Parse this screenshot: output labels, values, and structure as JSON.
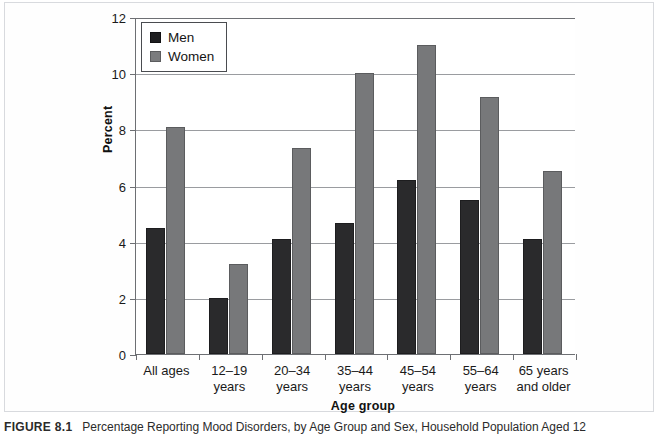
{
  "caption": {
    "label": "FIGURE 8.1",
    "text": "Percentage Reporting Mood Disorders, by Age Group and Sex, Household Population Aged 12"
  },
  "legend": {
    "items": [
      {
        "label": "Men",
        "color": "#1f1f21"
      },
      {
        "label": "Women",
        "color": "#7b7c7e"
      }
    ]
  },
  "chart_data": {
    "type": "bar",
    "title": "",
    "xlabel": "Age group",
    "ylabel": "Percent",
    "ylim": [
      0,
      12
    ],
    "yticks": [
      0,
      2,
      4,
      6,
      8,
      10,
      12
    ],
    "ytick_labels": [
      "0",
      "2",
      "4",
      "6",
      "8",
      "10",
      "12"
    ],
    "grid": true,
    "legend_position": "top-left-inside",
    "categories": [
      "All ages",
      "12–19 years",
      "20–34 years",
      "35–44 years",
      "45–54 years",
      "55–64 years",
      "65 years and older"
    ],
    "category_lines": [
      [
        "All ages",
        ""
      ],
      [
        "12–19",
        "years"
      ],
      [
        "20–34",
        "years"
      ],
      [
        "35–44",
        "years"
      ],
      [
        "45–54",
        "years"
      ],
      [
        "55–64",
        "years"
      ],
      [
        "65 years",
        "and older"
      ]
    ],
    "series": [
      {
        "name": "Men",
        "color": "#2a2a2c",
        "values": [
          4.5,
          2.0,
          4.1,
          4.65,
          6.2,
          5.5,
          4.1
        ]
      },
      {
        "name": "Women",
        "color": "#77787a",
        "values": [
          8.1,
          3.2,
          7.35,
          10.0,
          11.0,
          9.15,
          6.5
        ]
      }
    ]
  }
}
